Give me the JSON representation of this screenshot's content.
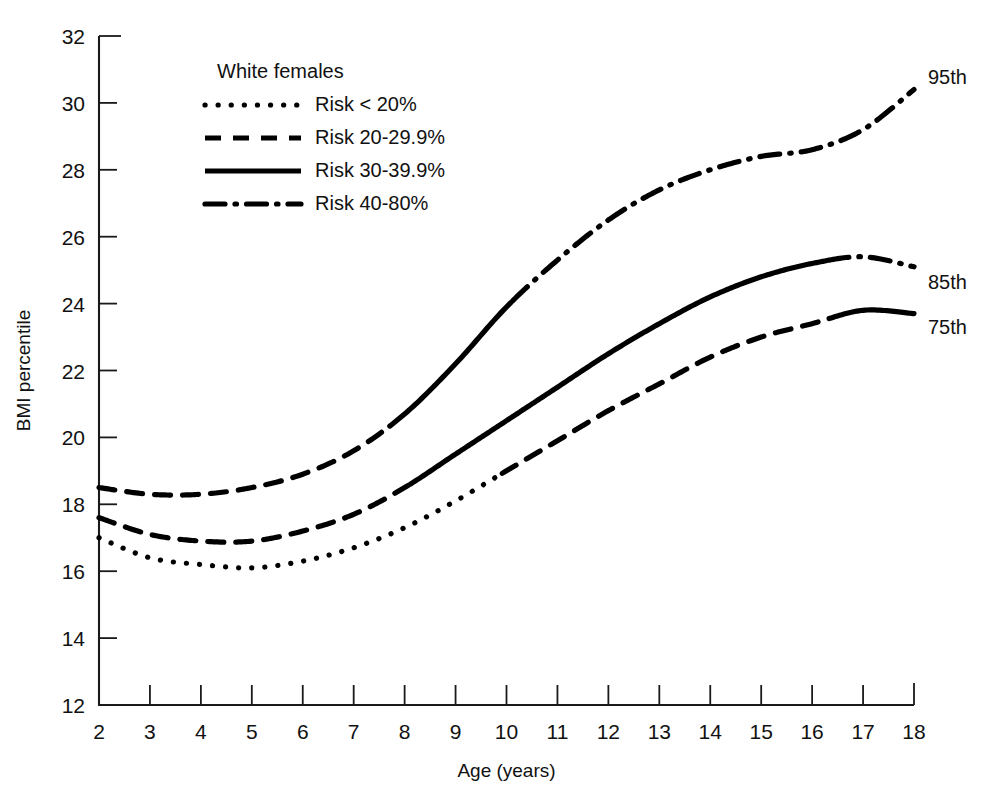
{
  "chart_data": {
    "type": "line",
    "title": "",
    "xlabel": "Age (years)",
    "ylabel": "BMI percentile",
    "xlim": [
      2,
      18
    ],
    "ylim": [
      12,
      32
    ],
    "grid": false,
    "legend_position": "top-left-inside",
    "legend_title": "White females",
    "x_ticks": [
      "2",
      "3",
      "4",
      "5",
      "6",
      "7",
      "8",
      "9",
      "10",
      "11",
      "12",
      "13",
      "14",
      "15",
      "16",
      "17",
      "18"
    ],
    "y_ticks": [
      "12",
      "14",
      "16",
      "18",
      "20",
      "22",
      "24",
      "26",
      "28",
      "30",
      "32"
    ],
    "legend_entries": [
      {
        "label": "Risk < 20%",
        "style": "dotted"
      },
      {
        "label": "Risk 20-29.9%",
        "style": "dashed"
      },
      {
        "label": "Risk 30-39.9%",
        "style": "solid"
      },
      {
        "label": "Risk 40-80%",
        "style": "dashdot"
      }
    ],
    "x": [
      2,
      3,
      4,
      5,
      6,
      7,
      8,
      9,
      10,
      11,
      12,
      13,
      14,
      15,
      16,
      17,
      18
    ],
    "series": [
      {
        "name": "95th",
        "end_label": "95th",
        "values": [
          18.5,
          18.3,
          18.3,
          18.5,
          18.9,
          19.6,
          20.7,
          22.2,
          23.9,
          25.3,
          26.5,
          27.4,
          28.0,
          28.4,
          28.6,
          29.2,
          30.4
        ],
        "segments": [
          {
            "style": "dashed",
            "x_start": 2.0,
            "x_end": 7.7
          },
          {
            "style": "solid",
            "x_start": 7.7,
            "x_end": 10.1
          },
          {
            "style": "dashdot",
            "x_start": 10.1,
            "x_end": 18.0
          }
        ]
      },
      {
        "name": "85th",
        "end_label": "85th",
        "values": [
          17.6,
          17.1,
          16.9,
          16.9,
          17.2,
          17.7,
          18.5,
          19.5,
          20.5,
          21.5,
          22.5,
          23.4,
          24.2,
          24.8,
          25.2,
          25.4,
          25.1
        ],
        "segments": [
          {
            "style": "dashed",
            "x_start": 2.0,
            "x_end": 8.1
          },
          {
            "style": "solid",
            "x_start": 8.1,
            "x_end": 16.3
          },
          {
            "style": "dashdot",
            "x_start": 16.3,
            "x_end": 18.0
          }
        ]
      },
      {
        "name": "75th",
        "end_label": "75th",
        "values": [
          17.0,
          16.4,
          16.2,
          16.1,
          16.3,
          16.7,
          17.3,
          18.1,
          19.0,
          19.9,
          20.8,
          21.6,
          22.4,
          23.0,
          23.4,
          23.8,
          23.7
        ],
        "segments": [
          {
            "style": "dotted",
            "x_start": 2.0,
            "x_end": 9.9
          },
          {
            "style": "dashed",
            "x_start": 9.9,
            "x_end": 16.3
          },
          {
            "style": "solid",
            "x_start": 16.3,
            "x_end": 18.0
          }
        ]
      }
    ]
  },
  "axes": {
    "x_title": "Age (years)",
    "y_title": "BMI percentile"
  },
  "legend": {
    "heading": "White females",
    "items": [
      {
        "label": "Risk < 20%"
      },
      {
        "label": "Risk 20-29.9%"
      },
      {
        "label": "Risk 30-39.9%"
      },
      {
        "label": "Risk 40-80%"
      }
    ]
  },
  "end_labels": {
    "top": "95th",
    "middle": "85th",
    "bottom": "75th"
  },
  "colors": {
    "ink": "#111111",
    "line": "#000000",
    "background": "#ffffff"
  }
}
